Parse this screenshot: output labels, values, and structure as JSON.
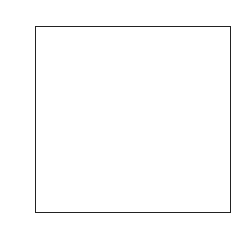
{
  "chart_data": {
    "type": "heatmap",
    "colormap": "gray",
    "xlabel": "",
    "ylabel": "",
    "xlim": [
      -0.5,
      31.5
    ],
    "ylim": [
      31.5,
      -0.5
    ],
    "xticks": [
      0,
      5,
      10,
      15,
      20,
      25,
      30
    ],
    "yticks": [
      0,
      5,
      10,
      15,
      20,
      25,
      30
    ],
    "grid": false,
    "values": [
      [
        100,
        95,
        40,
        60,
        90,
        95,
        90,
        85,
        80,
        85,
        90,
        85,
        80,
        80,
        75,
        70,
        65,
        55,
        45,
        40,
        40,
        45,
        40,
        45,
        50,
        55,
        60,
        55,
        60,
        70,
        75,
        80
      ],
      [
        105,
        100,
        80,
        95,
        100,
        95,
        90,
        88,
        85,
        85,
        90,
        88,
        85,
        80,
        75,
        70,
        65,
        55,
        45,
        40,
        40,
        42,
        40,
        45,
        50,
        55,
        55,
        50,
        55,
        60,
        65,
        70
      ],
      [
        110,
        115,
        120,
        105,
        100,
        95,
        95,
        90,
        90,
        88,
        88,
        85,
        85,
        82,
        78,
        72,
        68,
        58,
        48,
        42,
        40,
        40,
        42,
        45,
        48,
        50,
        50,
        48,
        50,
        55,
        55,
        60
      ],
      [
        120,
        125,
        115,
        105,
        100,
        98,
        95,
        92,
        90,
        90,
        88,
        85,
        85,
        82,
        78,
        75,
        70,
        62,
        50,
        44,
        40,
        38,
        40,
        42,
        45,
        48,
        48,
        46,
        48,
        50,
        50,
        55
      ],
      [
        115,
        120,
        110,
        100,
        98,
        95,
        92,
        90,
        90,
        88,
        86,
        85,
        84,
        82,
        80,
        76,
        72,
        65,
        55,
        46,
        40,
        38,
        38,
        40,
        42,
        45,
        46,
        45,
        46,
        48,
        48,
        50
      ],
      [
        110,
        115,
        105,
        65,
        95,
        95,
        92,
        90,
        90,
        88,
        86,
        85,
        84,
        82,
        80,
        78,
        74,
        68,
        58,
        48,
        42,
        38,
        38,
        40,
        42,
        44,
        45,
        44,
        45,
        46,
        46,
        48
      ],
      [
        120,
        110,
        100,
        60,
        92,
        94,
        92,
        90,
        88,
        88,
        86,
        85,
        84,
        84,
        82,
        80,
        78,
        72,
        62,
        52,
        44,
        40,
        38,
        40,
        42,
        44,
        44,
        44,
        44,
        45,
        45,
        46
      ],
      [
        125,
        100,
        95,
        70,
        90,
        92,
        92,
        90,
        88,
        88,
        86,
        86,
        86,
        86,
        84,
        84,
        82,
        78,
        68,
        56,
        46,
        42,
        40,
        40,
        42,
        44,
        44,
        44,
        44,
        44,
        44,
        45
      ],
      [
        118,
        95,
        90,
        85,
        90,
        92,
        92,
        92,
        90,
        90,
        88,
        88,
        88,
        90,
        92,
        95,
        100,
        110,
        95,
        62,
        48,
        44,
        42,
        42,
        42,
        44,
        44,
        44,
        44,
        44,
        44,
        45
      ],
      [
        105,
        90,
        88,
        88,
        90,
        92,
        94,
        94,
        92,
        92,
        92,
        94,
        98,
        102,
        108,
        112,
        118,
        125,
        110,
        68,
        50,
        46,
        44,
        44,
        44,
        44,
        44,
        44,
        44,
        44,
        44,
        45
      ],
      [
        60,
        55,
        80,
        90,
        95,
        96,
        98,
        100,
        100,
        102,
        104,
        108,
        112,
        118,
        125,
        130,
        138,
        140,
        120,
        72,
        52,
        48,
        46,
        46,
        46,
        46,
        46,
        46,
        46,
        46,
        46,
        46
      ],
      [
        25,
        30,
        70,
        95,
        110,
        120,
        115,
        110,
        112,
        118,
        125,
        130,
        140,
        150,
        155,
        150,
        160,
        150,
        125,
        72,
        52,
        48,
        46,
        46,
        46,
        46,
        46,
        46,
        46,
        46,
        46,
        46
      ],
      [
        20,
        25,
        65,
        105,
        130,
        140,
        135,
        120,
        115,
        125,
        135,
        150,
        165,
        175,
        170,
        140,
        150,
        135,
        110,
        65,
        50,
        46,
        45,
        45,
        45,
        45,
        45,
        45,
        46,
        46,
        46,
        46
      ],
      [
        25,
        30,
        75,
        115,
        140,
        150,
        145,
        130,
        120,
        130,
        145,
        160,
        175,
        185,
        180,
        150,
        120,
        100,
        80,
        55,
        46,
        44,
        44,
        44,
        44,
        44,
        44,
        44,
        46,
        48,
        50,
        52
      ],
      [
        35,
        40,
        85,
        120,
        145,
        155,
        150,
        140,
        125,
        120,
        130,
        150,
        165,
        175,
        170,
        155,
        120,
        90,
        60,
        42,
        40,
        40,
        40,
        40,
        40,
        40,
        40,
        42,
        48,
        60,
        80,
        70
      ],
      [
        50,
        55,
        90,
        125,
        148,
        155,
        150,
        145,
        130,
        115,
        100,
        95,
        120,
        150,
        160,
        150,
        125,
        85,
        50,
        32,
        30,
        30,
        30,
        30,
        30,
        32,
        35,
        40,
        55,
        90,
        120,
        80
      ],
      [
        60,
        65,
        95,
        125,
        145,
        150,
        148,
        145,
        135,
        110,
        70,
        40,
        60,
        120,
        145,
        140,
        115,
        75,
        38,
        20,
        18,
        18,
        18,
        18,
        20,
        22,
        28,
        38,
        70,
        140,
        150,
        75
      ],
      [
        65,
        70,
        95,
        120,
        140,
        145,
        145,
        140,
        130,
        105,
        50,
        20,
        30,
        90,
        125,
        120,
        100,
        60,
        28,
        14,
        12,
        12,
        12,
        12,
        14,
        16,
        22,
        35,
        90,
        170,
        160,
        70
      ],
      [
        70,
        75,
        95,
        115,
        130,
        140,
        140,
        135,
        125,
        100,
        45,
        15,
        18,
        50,
        80,
        85,
        70,
        40,
        20,
        12,
        10,
        10,
        10,
        10,
        12,
        14,
        20,
        40,
        120,
        180,
        150,
        65
      ],
      [
        72,
        75,
        92,
        110,
        120,
        125,
        125,
        120,
        115,
        95,
        60,
        30,
        20,
        25,
        35,
        38,
        32,
        22,
        15,
        12,
        10,
        10,
        10,
        10,
        12,
        14,
        22,
        50,
        140,
        175,
        130,
        60
      ],
      [
        70,
        72,
        88,
        100,
        110,
        112,
        112,
        110,
        105,
        90,
        70,
        55,
        45,
        40,
        38,
        36,
        30,
        22,
        16,
        14,
        12,
        12,
        12,
        12,
        14,
        18,
        28,
        60,
        130,
        150,
        110,
        55
      ],
      [
        68,
        70,
        82,
        90,
        98,
        100,
        100,
        98,
        95,
        90,
        85,
        95,
        110,
        90,
        60,
        40,
        30,
        22,
        18,
        16,
        14,
        14,
        14,
        14,
        16,
        20,
        32,
        65,
        110,
        120,
        90,
        52
      ],
      [
        66,
        68,
        78,
        85,
        90,
        92,
        92,
        92,
        92,
        95,
        110,
        130,
        150,
        130,
        90,
        60,
        40,
        28,
        22,
        20,
        18,
        18,
        18,
        18,
        20,
        24,
        38,
        60,
        85,
        90,
        70,
        50
      ],
      [
        64,
        66,
        74,
        80,
        84,
        86,
        88,
        90,
        95,
        105,
        120,
        140,
        160,
        150,
        110,
        70,
        45,
        32,
        26,
        24,
        22,
        22,
        22,
        22,
        24,
        28,
        40,
        55,
        65,
        65,
        55,
        48
      ],
      [
        62,
        64,
        70,
        75,
        78,
        80,
        82,
        85,
        90,
        100,
        112,
        125,
        135,
        125,
        95,
        68,
        48,
        36,
        30,
        28,
        26,
        26,
        26,
        26,
        28,
        32,
        40,
        48,
        52,
        52,
        48,
        46
      ],
      [
        60,
        62,
        66,
        70,
        72,
        74,
        76,
        80,
        84,
        90,
        96,
        100,
        100,
        92,
        78,
        62,
        50,
        42,
        36,
        34,
        32,
        32,
        32,
        32,
        34,
        36,
        40,
        44,
        46,
        46,
        45,
        44
      ],
      [
        60,
        60,
        62,
        64,
        66,
        68,
        70,
        72,
        74,
        78,
        80,
        80,
        78,
        74,
        68,
        60,
        54,
        48,
        44,
        42,
        40,
        40,
        40,
        40,
        42,
        44,
        46,
        48,
        48,
        48,
        48,
        48
      ],
      [
        62,
        60,
        60,
        60,
        62,
        64,
        66,
        68,
        70,
        72,
        72,
        72,
        70,
        68,
        64,
        60,
        56,
        52,
        50,
        48,
        48,
        48,
        48,
        48,
        50,
        52,
        54,
        56,
        56,
        56,
        56,
        56
      ],
      [
        64,
        62,
        60,
        60,
        60,
        62,
        64,
        66,
        66,
        68,
        68,
        68,
        66,
        64,
        62,
        60,
        58,
        56,
        54,
        54,
        54,
        54,
        54,
        54,
        56,
        58,
        60,
        62,
        62,
        62,
        62,
        62
      ],
      [
        66,
        64,
        62,
        60,
        60,
        62,
        62,
        64,
        64,
        64,
        64,
        64,
        64,
        62,
        62,
        62,
        60,
        60,
        60,
        60,
        60,
        60,
        60,
        60,
        62,
        62,
        64,
        64,
        66,
        66,
        66,
        66
      ],
      [
        68,
        66,
        64,
        62,
        62,
        62,
        62,
        62,
        62,
        62,
        62,
        62,
        62,
        62,
        62,
        62,
        62,
        62,
        62,
        62,
        62,
        62,
        62,
        62,
        64,
        64,
        66,
        66,
        68,
        68,
        68,
        68
      ],
      [
        70,
        68,
        66,
        64,
        64,
        64,
        64,
        64,
        64,
        64,
        64,
        64,
        64,
        64,
        64,
        64,
        64,
        64,
        64,
        64,
        64,
        64,
        64,
        64,
        66,
        66,
        68,
        68,
        70,
        70,
        70,
        70
      ]
    ]
  }
}
